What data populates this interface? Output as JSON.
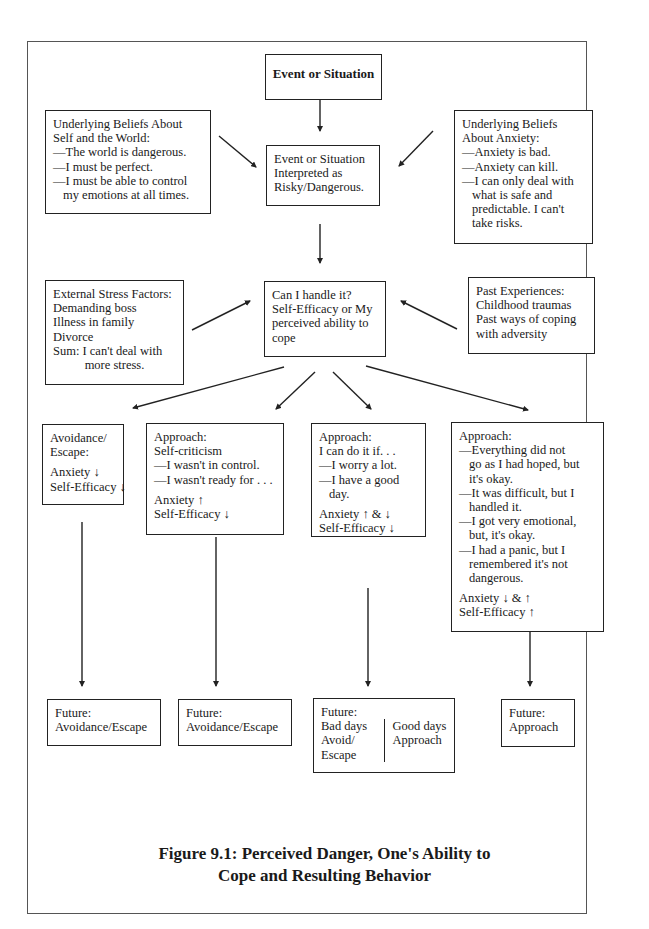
{
  "figure": {
    "caption_line1": "Figure 9.1: Perceived Danger, One's Ability to",
    "caption_line2": "Cope and Resulting Behavior"
  },
  "nodes": {
    "event": {
      "title": "Event or Situation"
    },
    "beliefs_self": {
      "lines": [
        "Underlying Beliefs About",
        "Self and the World:",
        "—The world is dangerous.",
        "—I must be perfect.",
        "—I must be able to control",
        "my emotions at all times."
      ]
    },
    "interpreted": {
      "lines": [
        "Event or Situation",
        "Interpreted as",
        "Risky/Dangerous."
      ]
    },
    "beliefs_anxiety": {
      "lines": [
        "Underlying Beliefs",
        "About Anxiety:",
        "—Anxiety is bad.",
        "—Anxiety can kill.",
        "—I can only deal with",
        "what is safe and",
        "predictable. I can't",
        "take risks."
      ]
    },
    "external_stress": {
      "lines": [
        "External Stress Factors:",
        "Demanding boss",
        "Illness in family",
        "Divorce",
        "Sum: I can't deal with",
        "more stress."
      ]
    },
    "self_efficacy": {
      "lines": [
        "Can I handle it?",
        "Self-Efficacy or My",
        "perceived ability to",
        "cope"
      ]
    },
    "past_experiences": {
      "lines": [
        "Past Experiences:",
        "Childhood traumas",
        "Past ways of coping",
        "with adversity"
      ]
    },
    "avoidance": {
      "lines": [
        "Avoidance/",
        "Escape:"
      ],
      "anxiety": "Anxiety ↓",
      "self_efficacy": "Self-Efficacy ↓"
    },
    "self_criticism": {
      "lines": [
        "Approach:",
        "Self-criticism",
        "—I wasn't in control.",
        "—I wasn't ready for . . ."
      ],
      "anxiety": "Anxiety ↑",
      "self_efficacy": "Self-Efficacy ↓"
    },
    "conditional": {
      "lines": [
        "Approach:",
        "I can do it if. . .",
        "—I worry a lot.",
        "—I have a good",
        "day."
      ],
      "anxiety": "Anxiety ↑ & ↓",
      "self_efficacy": "Self-Efficacy ↓"
    },
    "acceptance": {
      "lines": [
        "Approach:",
        "—Everything did not",
        "go as I had hoped, but",
        "it's okay.",
        "—It was difficult, but I",
        "handled it.",
        "—I got very emotional,",
        "but, it's okay.",
        "—I had a panic, but I",
        "remembered it's not",
        "dangerous."
      ],
      "anxiety": "Anxiety ↓ & ↑",
      "self_efficacy": "Self-Efficacy ↑"
    },
    "future1": {
      "lines": [
        "Future:",
        "Avoidance/Escape"
      ]
    },
    "future2": {
      "lines": [
        "Future:",
        "Avoidance/Escape"
      ]
    },
    "future3": {
      "label": "Future:",
      "bad": [
        "Bad days",
        "Avoid/",
        "Escape"
      ],
      "good": [
        "Good days",
        "Approach"
      ]
    },
    "future4": {
      "lines": [
        "Future:",
        "Approach"
      ]
    }
  }
}
